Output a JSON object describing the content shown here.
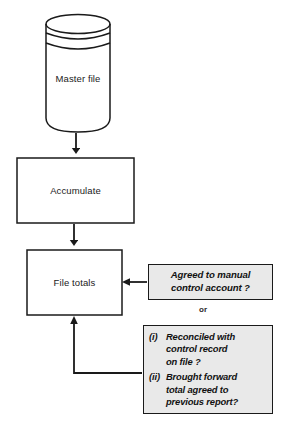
{
  "diagram": {
    "type": "flowchart",
    "colors": {
      "line": "#1a1a1a",
      "note_fill": "#e9e9e9",
      "note_border": "#1a1a1a",
      "background": "#ffffff"
    },
    "nodes": [
      {
        "id": "master-file",
        "shape": "cylinder",
        "label": "Master file"
      },
      {
        "id": "accumulate",
        "shape": "rectangle",
        "label": "Accumulate"
      },
      {
        "id": "file-totals",
        "shape": "rectangle",
        "label": "File totals"
      }
    ],
    "connector_label": "or",
    "notes": [
      {
        "id": "note-1",
        "lines": [
          "Agreed to manual",
          "control account ?"
        ]
      },
      {
        "id": "note-2",
        "items": [
          {
            "marker": "(i)",
            "lines": [
              "Reconciled with",
              "control record",
              "on file ?"
            ]
          },
          {
            "marker": "(ii)",
            "lines": [
              "Brought forward",
              "total agreed to",
              "previous report?"
            ]
          }
        ]
      }
    ]
  }
}
